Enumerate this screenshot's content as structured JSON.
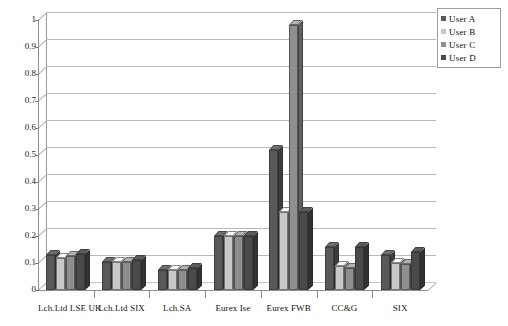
{
  "chart_data": {
    "type": "bar",
    "title": "",
    "subtitle": "",
    "xlabel": "",
    "ylabel": "",
    "ylim": [
      0,
      1
    ],
    "ytick_labels": [
      "1",
      "0.9",
      "0.8",
      "0.7",
      "0.6",
      "0.5",
      "0.4",
      "0.3",
      "0.2",
      "0.1",
      "0"
    ],
    "ytick_values": [
      1,
      0.9,
      0.8,
      0.7,
      0.6,
      0.5,
      0.4,
      0.3,
      0.2,
      0.1,
      0
    ],
    "grid": true,
    "grid_axis": "y",
    "legend_position": "top-right",
    "style": "3d-clustered-column",
    "categories": [
      "Lch.Ltd LSE UK",
      "Lch.Ltd SIX",
      "Lch.SA",
      "Eurex Ise",
      "Eurex FWB",
      "CC&G",
      "SIX"
    ],
    "series": [
      {
        "name": "User A",
        "color": "#595959",
        "values": [
          0.13,
          0.105,
          0.075,
          0.2,
          0.52,
          0.16,
          0.13
        ]
      },
      {
        "name": "User B",
        "color": "#c9c9c9",
        "values": [
          0.12,
          0.105,
          0.075,
          0.2,
          0.29,
          0.09,
          0.1
        ]
      },
      {
        "name": "User C",
        "color": "#8f8f8f",
        "values": [
          0.125,
          0.105,
          0.075,
          0.2,
          0.98,
          0.08,
          0.095
        ]
      },
      {
        "name": "User D",
        "color": "#4a4a4a",
        "values": [
          0.135,
          0.11,
          0.08,
          0.2,
          0.29,
          0.16,
          0.14
        ]
      }
    ]
  },
  "legend": {
    "items": [
      {
        "label": "User A",
        "color": "#595959"
      },
      {
        "label": "User B",
        "color": "#c9c9c9"
      },
      {
        "label": "User C",
        "color": "#8f8f8f"
      },
      {
        "label": "User D",
        "color": "#4a4a4a"
      }
    ]
  },
  "colors": {
    "background": "#ffffff",
    "axis": "#8f8f8f",
    "gridline": "#b9b9b9",
    "text": "#121212",
    "legend_border": "#9d9d9d"
  }
}
